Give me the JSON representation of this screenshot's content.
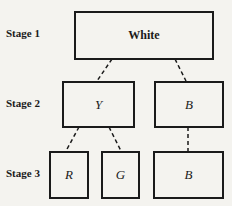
{
  "stages": [
    "Stage 1",
    "Stage 2",
    "Stage 3"
  ],
  "nodes": {
    "white": "White",
    "y": "Y",
    "b2": "B",
    "r": "R",
    "g": "G",
    "b3": "B"
  }
}
